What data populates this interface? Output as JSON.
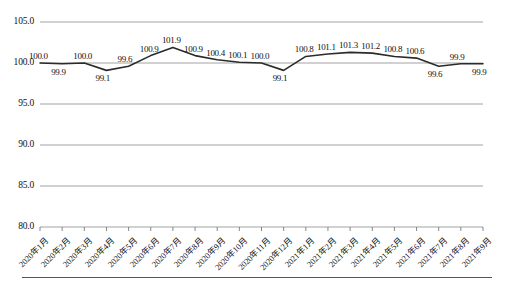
{
  "chart_data": {
    "type": "line",
    "title": "",
    "xlabel": "",
    "ylabel": "",
    "ylim": [
      80.0,
      105.0
    ],
    "yticks": [
      "80.0",
      "85.0",
      "90.0",
      "95.0",
      "100.0",
      "105.0"
    ],
    "ytick_values": [
      80.0,
      85.0,
      90.0,
      95.0,
      100.0,
      105.0
    ],
    "grid": true,
    "legend": "none",
    "line_color": "#2b2b2b",
    "categories": [
      "2020年1月",
      "2020年2月",
      "2020年3月",
      "2020年4月",
      "2020年5月",
      "2020年6月",
      "2020年7月",
      "2020年8月",
      "2020年9月",
      "2020年10月",
      "2020年11月",
      "2020年12月",
      "2021年1月",
      "2021年2月",
      "2021年3月",
      "2021年4月",
      "2021年5月",
      "2021年6月",
      "2021年7月",
      "2021年8月",
      "2021年9月"
    ],
    "values": [
      100.0,
      99.9,
      100.0,
      99.1,
      99.6,
      100.9,
      101.9,
      100.9,
      100.4,
      100.1,
      100.0,
      99.1,
      100.8,
      101.1,
      101.3,
      101.2,
      100.8,
      100.6,
      99.6,
      99.9,
      99.9
    ],
    "data_labels": [
      "100.0",
      "99.9",
      "100.0",
      "99.1",
      "99.6",
      "100.9",
      "101.9",
      "100.9",
      "100.4",
      "100.1",
      "100.0",
      "99.1",
      "100.8",
      "101.1",
      "101.3",
      "101.2",
      "100.8",
      "100.6",
      "99.6",
      "99.9",
      "99.9"
    ]
  }
}
